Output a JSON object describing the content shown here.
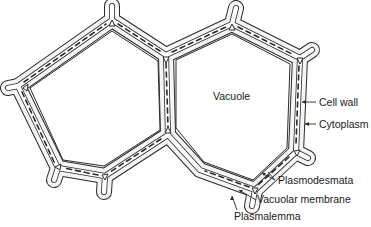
{
  "labels": {
    "vacuole": "Vacuole",
    "cell_wall": "Cell wall",
    "cytoplasm": "Cytoplasm",
    "plasmodesmata": "Plasmodesmata",
    "vacuolar_membrane": "Vacuolar membrane",
    "plasmalemma": "Plasmalemma"
  },
  "colors": {
    "line": "#2a2a2a",
    "stipple": "#9a9a9a",
    "background": "#ffffff"
  }
}
